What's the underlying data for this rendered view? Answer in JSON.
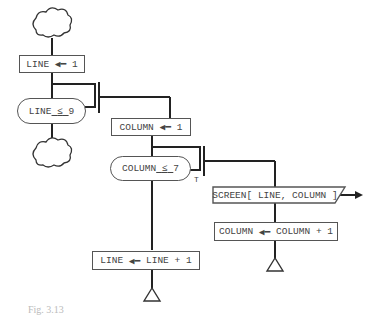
{
  "diagram": {
    "type": "structured-flowchart",
    "nodes": {
      "line_init": {
        "lhs": "LINE",
        "rhs": "1"
      },
      "line_cond": {
        "text": "LINE",
        "op": "≤",
        "value": "9"
      },
      "col_init": {
        "lhs": "COLUMN",
        "rhs": "1"
      },
      "col_cond": {
        "text": "COLUMN",
        "op": "≤",
        "value": "7"
      },
      "col_cond_true_label": "T",
      "output": {
        "text": "SCREEN[ LINE, COLUMN ]"
      },
      "col_incr": {
        "lhs": "COLUMN",
        "rhs": "COLUMN + 1"
      },
      "line_incr": {
        "lhs": "LINE",
        "rhs": "LINE + 1"
      }
    },
    "caption": "Fig. 3.13"
  },
  "colors": {
    "line": "#222222",
    "box_border": "#555555",
    "text": "#444444"
  }
}
